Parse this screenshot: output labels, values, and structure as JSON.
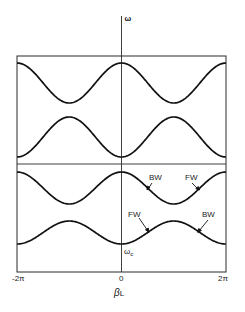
{
  "chart_data": {
    "type": "line",
    "title": "",
    "xlabel": "βL",
    "ylabel": "ω",
    "xlim": [
      "-2π",
      "2π"
    ],
    "x_ticks": [
      "-2π",
      "0",
      "2π"
    ],
    "grid": false,
    "legend": null,
    "series": [
      {
        "name": "band-1",
        "shape": "cos",
        "peak_at_zero": true,
        "y_max_px": 63,
        "y_min_px": 103
      },
      {
        "name": "band-2",
        "shape": "cos",
        "peak_at_zero": false,
        "y_max_px": 117,
        "y_min_px": 157
      },
      {
        "name": "band-3",
        "shape": "cos",
        "peak_at_zero": true,
        "y_max_px": 172,
        "y_min_px": 204
      },
      {
        "name": "band-4",
        "shape": "cos",
        "peak_at_zero": false,
        "y_max_px": 221,
        "y_min_px": 244
      }
    ],
    "annotations": [
      {
        "text": "BW",
        "x": 149,
        "y": 180,
        "arrow": [
          151,
          183,
          147,
          189
        ]
      },
      {
        "text": "FW",
        "x": 185,
        "y": 180,
        "arrow": [
          193,
          183,
          199,
          189
        ]
      },
      {
        "text": "FW",
        "x": 128,
        "y": 217,
        "arrow": [
          139,
          218,
          149,
          231
        ]
      },
      {
        "text": "BW",
        "x": 202,
        "y": 217,
        "arrow": [
          208,
          220,
          198,
          231
        ]
      },
      {
        "text": "ωc",
        "x": 124,
        "y": 255
      }
    ]
  },
  "axes": {
    "y_label": "ω",
    "x_label_main": "β",
    "x_label_sub": "L",
    "tick_left": "-2π",
    "tick_center": "0",
    "tick_right": "2π"
  },
  "annotations": {
    "upper_bw": "BW",
    "upper_fw": "FW",
    "lower_fw": "FW",
    "lower_bw": "BW",
    "omega_c_main": "ω",
    "omega_c_sub": "c"
  }
}
